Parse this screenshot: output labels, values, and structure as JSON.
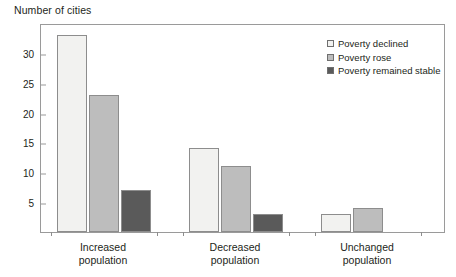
{
  "chart_data": {
    "type": "bar",
    "title": "Number of cities",
    "xlabel": "",
    "ylabel": "Number of cities",
    "categories": [
      "Increased population",
      "Decreased population",
      "Unchanged population"
    ],
    "category_lines": [
      [
        "Increased",
        "population"
      ],
      [
        "Decreased",
        "population"
      ],
      [
        "Unchanged",
        "population"
      ]
    ],
    "series": [
      {
        "name": "Poverty declined",
        "values": [
          33,
          14,
          3
        ],
        "color": "#f2f2f0"
      },
      {
        "name": "Poverty rose",
        "values": [
          23,
          11,
          4
        ],
        "color": "#bdbdbd"
      },
      {
        "name": "Poverty remained stable",
        "values": [
          7,
          3,
          0
        ],
        "color": "#5a5a5a"
      }
    ],
    "ylim": [
      0,
      35
    ],
    "yticks": [
      5,
      10,
      15,
      20,
      25,
      30
    ],
    "ytick_labels": [
      "5",
      "10",
      "15",
      "20",
      "25",
      "30"
    ],
    "grid": false,
    "legend_position": "top-right",
    "axis_color": "#9a9a9a",
    "bar_border_color": "#8d8d8d",
    "background": "#ffffff"
  },
  "legend": {
    "items": [
      {
        "label": "Poverty declined"
      },
      {
        "label": "Poverty rose"
      },
      {
        "label": "Poverty remained stable"
      }
    ]
  }
}
